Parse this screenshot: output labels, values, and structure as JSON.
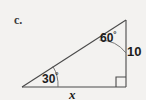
{
  "figure": {
    "part_label": "c.",
    "shape": "right-triangle",
    "background_color": "#f3f2f0",
    "stroke_color": "#4a4a4a",
    "text_color": "#1c1c1c",
    "vertices": {
      "left": [
        22,
        87
      ],
      "bottom_right": [
        126,
        87
      ],
      "apex": [
        126,
        20
      ]
    },
    "angles": [
      {
        "name": "left-angle",
        "value": "30",
        "degree_symbol": "°",
        "at_vertex": "left"
      },
      {
        "name": "apex-angle",
        "value": "60",
        "degree_symbol": "°",
        "at_vertex": "apex"
      },
      {
        "name": "right-angle",
        "value": "90",
        "marker": "square",
        "at_vertex": "bottom_right"
      }
    ],
    "side_labels": [
      {
        "name": "vertical-leg-label",
        "text": "10",
        "side": "right"
      },
      {
        "name": "horizontal-leg-label",
        "text": "x",
        "side": "bottom"
      }
    ]
  }
}
